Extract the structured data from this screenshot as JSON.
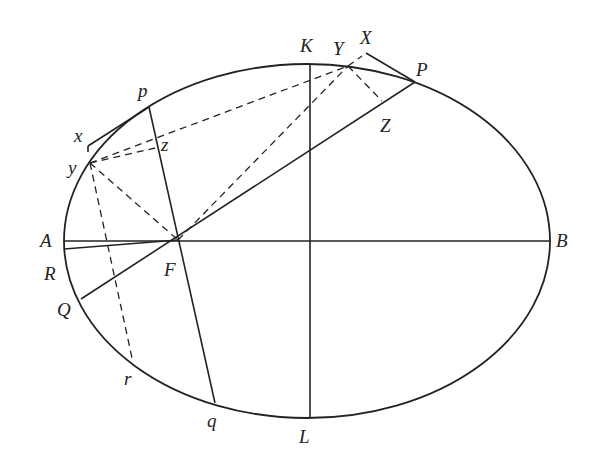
{
  "diagram": {
    "type": "ellipse-geometry",
    "stroke_color": "#222222",
    "ellipse": {
      "cx": 307,
      "cy": 241,
      "rx": 243,
      "ry": 177
    },
    "labels": [
      {
        "id": "K",
        "text": "K",
        "x": 300,
        "y": 52
      },
      {
        "id": "Y",
        "text": "Y",
        "x": 333,
        "y": 55
      },
      {
        "id": "X",
        "text": "X",
        "x": 360,
        "y": 44
      },
      {
        "id": "P",
        "text": "P",
        "x": 416,
        "y": 76
      },
      {
        "id": "Z",
        "text": "Z",
        "x": 380,
        "y": 132
      },
      {
        "id": "p",
        "text": "p",
        "x": 138,
        "y": 97
      },
      {
        "id": "x",
        "text": "x",
        "x": 74,
        "y": 142
      },
      {
        "id": "z",
        "text": "z",
        "x": 161,
        "y": 151
      },
      {
        "id": "y",
        "text": "y",
        "x": 68,
        "y": 174
      },
      {
        "id": "A",
        "text": "A",
        "x": 40,
        "y": 247
      },
      {
        "id": "B",
        "text": "B",
        "x": 556,
        "y": 247
      },
      {
        "id": "R",
        "text": "R",
        "x": 44,
        "y": 280
      },
      {
        "id": "F",
        "text": "F",
        "x": 164,
        "y": 276
      },
      {
        "id": "Q",
        "text": "Q",
        "x": 57,
        "y": 316
      },
      {
        "id": "r",
        "text": "r",
        "x": 124,
        "y": 385
      },
      {
        "id": "q",
        "text": "q",
        "x": 207,
        "y": 427
      },
      {
        "id": "L",
        "text": "L",
        "x": 299,
        "y": 443
      }
    ],
    "solid_lines": [
      {
        "name": "major-axis-AB",
        "x1": 64,
        "y1": 241,
        "x2": 550,
        "y2": 241
      },
      {
        "name": "minor-axis-KL",
        "x1": 310,
        "y1": 64,
        "x2": 310,
        "y2": 418
      },
      {
        "name": "chord-PQ",
        "x1": 415,
        "y1": 82,
        "x2": 81,
        "y2": 299
      },
      {
        "name": "chord-pq",
        "x1": 149,
        "y1": 107,
        "x2": 215,
        "y2": 403
      },
      {
        "name": "chord-through-R",
        "x1": 64,
        "y1": 249,
        "x2": 178,
        "y2": 240
      },
      {
        "name": "tangent-XP",
        "x1": 366,
        "y1": 53,
        "x2": 415,
        "y2": 82
      },
      {
        "name": "tangent-xp",
        "x1": 88,
        "y1": 146,
        "x2": 149,
        "y2": 107
      },
      {
        "name": "tick-x",
        "x1": 88,
        "y1": 146,
        "x2": 88,
        "y2": 152
      }
    ],
    "dashed_lines": [
      {
        "name": "yY-upper",
        "x1": 90,
        "y1": 163,
        "x2": 348,
        "y2": 66
      },
      {
        "name": "FY",
        "x1": 178,
        "y1": 240,
        "x2": 348,
        "y2": 66
      },
      {
        "name": "YX",
        "x1": 348,
        "y1": 66,
        "x2": 362,
        "y2": 56
      },
      {
        "name": "YZ",
        "x1": 348,
        "y1": 66,
        "x2": 382,
        "y2": 101
      },
      {
        "name": "yz",
        "x1": 90,
        "y1": 163,
        "x2": 155,
        "y2": 148
      },
      {
        "name": "yF",
        "x1": 90,
        "y1": 163,
        "x2": 178,
        "y2": 240
      },
      {
        "name": "yr",
        "x1": 90,
        "y1": 163,
        "x2": 132,
        "y2": 358
      }
    ]
  }
}
